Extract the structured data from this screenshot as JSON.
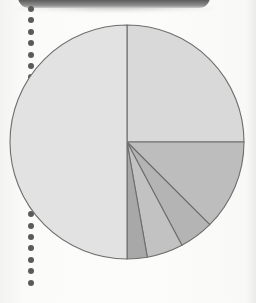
{
  "page": {
    "background_color": "#fbfbfa",
    "width": 256,
    "height": 303
  },
  "binder": {
    "bar_name": "binder-bar",
    "bar_color": "#333333",
    "hole_color": "#5b5b5b",
    "hole_count": 25,
    "hole_spacing": 11.4,
    "hole_diameter": 6,
    "hole_left": 28,
    "hole_start_top": 6
  },
  "chart_data": {
    "type": "pie",
    "title": "",
    "subtitle": "",
    "xlabel": "",
    "ylabel": "",
    "legend": [],
    "legend_position": "none",
    "grid": false,
    "labels_shown": false,
    "center": {
      "cx": 127,
      "cy": 142
    },
    "radius": 117,
    "start_angle_deg": 0,
    "direction": "clockwise",
    "stroke_color": "#6e6e6e",
    "stroke_width": 1.1,
    "categories": [
      "Slice 1",
      "Slice 2",
      "Slice 3",
      "Slice 4",
      "Slice 5",
      "Slice 6"
    ],
    "values": [
      25.0,
      12.5,
      4.7,
      5.0,
      2.8,
      50.0
    ],
    "angles_deg": [
      90.0,
      45.0,
      17.0,
      18.0,
      10.0,
      180.0
    ],
    "slice_boundaries_deg": [
      0,
      90,
      135,
      152,
      170,
      180,
      360
    ],
    "colors": [
      "#d9d9d9",
      "#bdbdbd",
      "#b4b4b4",
      "#c2c2c2",
      "#a8a8a8",
      "#e2e2e2"
    ],
    "ylim": [
      0,
      100
    ]
  }
}
